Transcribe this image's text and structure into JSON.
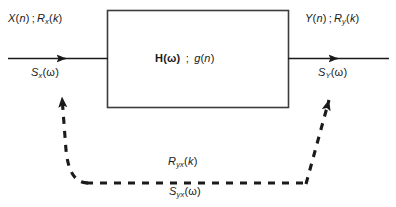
{
  "diagram": {
    "colors": {
      "background": "#ffffff",
      "line": "#1a1a1a",
      "box_stroke": "#3c3c3c",
      "text": "#1a1a1a"
    },
    "block": {
      "transfer_function": "H",
      "omega_symbol": "ω",
      "separator": ";",
      "impulse_response": "g",
      "label_text": "H(ω)  ;  g(n)"
    },
    "input": {
      "signal": "X",
      "index": "n",
      "autocorrelation": "R",
      "autocorrelation_subscript": "x",
      "lag": "k",
      "label_text": "X(n)  ;  Rₓ(k)",
      "psd": "S",
      "psd_subscript": "x",
      "psd_text": "Sₓ(ω)"
    },
    "output": {
      "signal": "Y",
      "index": "n",
      "autocorrelation": "R",
      "autocorrelation_subscript": "y",
      "lag": "k",
      "label_text": "Y(n)  ;  Rᵧ(k)",
      "psd": "S",
      "psd_subscript": "Y",
      "psd_text": "Sᵧ(ω)"
    },
    "cross": {
      "correlation": "R",
      "correlation_subscript": "yx",
      "lag": "k",
      "correlation_text": "Rᵧₓ(k)",
      "spectrum": "S",
      "spectrum_subscript": "yx",
      "spectrum_text": "Sᵧₓ(ω)"
    },
    "arrows": {
      "input_arrow": "right-arrow",
      "output_arrow": "right-arrow",
      "feedback_left_arrow": "up-left-arrow",
      "feedback_right_arrow": "up-right-arrow"
    }
  }
}
